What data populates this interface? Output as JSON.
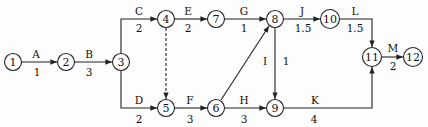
{
  "diagram": {
    "type": "activity-on-arrow network",
    "nodes": [
      {
        "id": "1",
        "x": 13,
        "y": 62
      },
      {
        "id": "2",
        "x": 66,
        "y": 62
      },
      {
        "id": "3",
        "x": 121,
        "y": 62
      },
      {
        "id": "4",
        "x": 166,
        "y": 19
      },
      {
        "id": "7",
        "x": 216,
        "y": 19
      },
      {
        "id": "8",
        "x": 275,
        "y": 19
      },
      {
        "id": "10",
        "x": 330,
        "y": 19
      },
      {
        "id": "5",
        "x": 166,
        "y": 108
      },
      {
        "id": "6",
        "x": 216,
        "y": 108
      },
      {
        "id": "9",
        "x": 275,
        "y": 108
      },
      {
        "id": "11",
        "x": 372,
        "y": 57
      },
      {
        "id": "12",
        "x": 413,
        "y": 57
      }
    ],
    "activities": [
      {
        "name": "A",
        "duration": "1",
        "from": "1",
        "to": "2"
      },
      {
        "name": "B",
        "duration": "3",
        "from": "2",
        "to": "3"
      },
      {
        "name": "C",
        "duration": "2",
        "from": "3",
        "to": "4"
      },
      {
        "name": "D",
        "duration": "2",
        "from": "3",
        "to": "5"
      },
      {
        "name": "E",
        "duration": "2",
        "from": "4",
        "to": "7"
      },
      {
        "name": "F",
        "duration": "3",
        "from": "5",
        "to": "6"
      },
      {
        "name": "G",
        "duration": "1",
        "from": "7",
        "to": "8"
      },
      {
        "name": "H",
        "duration": "3",
        "from": "6",
        "to": "9"
      },
      {
        "name": "I",
        "duration": "1",
        "from": "8",
        "to": "9"
      },
      {
        "name": "J",
        "duration": "1.5",
        "from": "8",
        "to": "10"
      },
      {
        "name": "K",
        "duration": "4",
        "from": "9",
        "to": "11"
      },
      {
        "name": "L",
        "duration": "1.5",
        "from": "10",
        "to": "11"
      },
      {
        "name": "M",
        "duration": "2",
        "from": "11",
        "to": "12"
      }
    ],
    "dummies": [
      {
        "from": "4",
        "to": "5",
        "style": "dashed"
      },
      {
        "from": "6",
        "to": "8",
        "style": "solid-unlabeled"
      }
    ]
  },
  "labels": {
    "A": "A",
    "A_d": "1",
    "B": "B",
    "B_d": "3",
    "C": "C",
    "C_d": "2",
    "D": "D",
    "D_d": "2",
    "E": "E",
    "E_d": "2",
    "F": "F",
    "F_d": "3",
    "G": "G",
    "G_d": "1",
    "H": "H",
    "H_d": "3",
    "I": "I",
    "I_d": "1",
    "J": "J",
    "J_d": "1.5",
    "K": "K",
    "K_d": "4",
    "L": "L",
    "L_d": "1.5",
    "M": "M",
    "M_d": "2",
    "n1": "1",
    "n2": "2",
    "n3": "3",
    "n4": "4",
    "n5": "5",
    "n6": "6",
    "n7": "7",
    "n8": "8",
    "n9": "9",
    "n10": "10",
    "n11": "11",
    "n12": "12"
  }
}
